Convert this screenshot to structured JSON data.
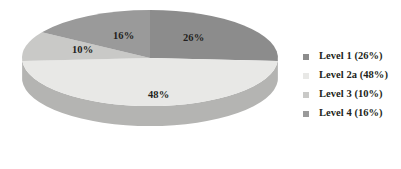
{
  "chart_data": {
    "type": "pie",
    "title": "",
    "subtitle": "",
    "xlabel": "",
    "ylabel": "",
    "grid": false,
    "legend_position": "right",
    "three_d": true,
    "categories": [
      "Level 1",
      "Level 2a",
      "Level 3",
      "Level 4"
    ],
    "values": [
      26,
      48,
      10,
      16
    ],
    "value_unit": "%",
    "slice_labels": [
      "26%",
      "48%",
      "10%",
      "16%"
    ],
    "legend_entries": [
      {
        "label": "Level 1 (26%)",
        "color": "#8c8c8c",
        "swatch": "legend-swatch-level-1"
      },
      {
        "label": "Level 2a (48%)",
        "color": "#e8e8e6",
        "swatch": "legend-swatch-level-2a"
      },
      {
        "label": "Level 3 (10%)",
        "color": "#c9c9c7",
        "swatch": "legend-swatch-level-3"
      },
      {
        "label": "Level 4 (16%)",
        "color": "#9a9a9a",
        "swatch": "legend-swatch-level-4"
      }
    ],
    "slices": [
      {
        "name": "Level 1",
        "value": 26,
        "label": "26%",
        "top_color": "#8c8c8c",
        "side_color": "#6e6e6e",
        "start_angle_deg": 0,
        "end_angle_deg": 93.6
      },
      {
        "name": "Level 2a",
        "value": 48,
        "label": "48%",
        "top_color": "#e8e8e6",
        "side_color": "#b4b4b2",
        "start_angle_deg": 93.6,
        "end_angle_deg": 266.4
      },
      {
        "name": "Level 3",
        "value": 10,
        "label": "10%",
        "top_color": "#c9c9c7",
        "side_color": "#a5a5a3",
        "start_angle_deg": 266.4,
        "end_angle_deg": 302.4
      },
      {
        "name": "Level 4",
        "value": 16,
        "label": "16%",
        "top_color": "#9a9a9a",
        "side_color": "#7c7c7c",
        "start_angle_deg": 302.4,
        "end_angle_deg": 360
      }
    ]
  },
  "colors": {
    "background": "#ffffff",
    "text": "#231f20",
    "level_1": "#8c8c8c",
    "level_2a": "#e8e8e6",
    "level_3": "#c9c9c7",
    "level_4": "#9a9a9a"
  }
}
